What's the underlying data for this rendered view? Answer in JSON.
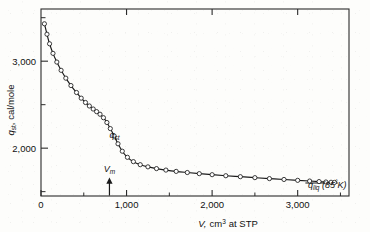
{
  "chart_data": {
    "type": "line",
    "title": "",
    "subtitle": "",
    "xlabel": "V, cm3 at STP",
    "xlabel_main": "V,",
    "xlabel_unit_base": "cm",
    "xlabel_unit_exp": "3",
    "xlabel_tail": "at STP",
    "ylabel_symbol": "q",
    "ylabel_symbol_sub": "st",
    "ylabel_rest": ", cal/mole",
    "xlim": [
      0,
      3600
    ],
    "ylim": [
      1450,
      3600
    ],
    "grid": false,
    "legend": "none",
    "x_major_ticks": [
      0,
      1000,
      2000,
      3000
    ],
    "x_major_tick_labels": [
      "0",
      "1,000",
      "2,000",
      "3,000"
    ],
    "x_minor_ticks": [
      500,
      1500,
      2500,
      3500
    ],
    "y_major_ticks": [
      2000,
      3000
    ],
    "y_major_tick_labels": [
      "2,000",
      "3,000"
    ],
    "y_minor_ticks": [
      1500,
      2500,
      3500
    ],
    "marker": "open-circle",
    "series": [
      {
        "name": "q_st",
        "x": [
          40,
          70,
          100,
          140,
          185,
          235,
          290,
          350,
          415,
          470,
          520,
          565,
          610,
          650,
          690,
          730,
          770,
          810,
          855,
          900,
          950,
          1010,
          1080,
          1160,
          1250,
          1350,
          1460,
          1580,
          1710,
          1850,
          2000,
          2160,
          2330,
          2500,
          2670,
          2840,
          3000,
          3140,
          3250,
          3330,
          3390,
          3430
        ],
        "y": [
          3430,
          3310,
          3200,
          3090,
          2990,
          2895,
          2805,
          2720,
          2640,
          2575,
          2525,
          2485,
          2450,
          2420,
          2390,
          2350,
          2295,
          2225,
          2140,
          2050,
          1965,
          1895,
          1845,
          1810,
          1785,
          1765,
          1748,
          1733,
          1720,
          1707,
          1695,
          1683,
          1672,
          1661,
          1650,
          1640,
          1630,
          1622,
          1616,
          1611,
          1608,
          1606
        ]
      }
    ],
    "reference_line": {
      "name": "q_liq (85 K)",
      "y": 1600,
      "x_start": 3090,
      "x_end": 3470
    },
    "annotations": [
      {
        "name": "q-st-curve-label",
        "text_symbol": "q",
        "text_sub": "st",
        "x": 800,
        "y": 2120
      },
      {
        "name": "vm-marker",
        "text_symbol": "V",
        "text_sub": "m",
        "x": 800,
        "arrow": "up",
        "y_label": 1730,
        "y_arrow_base": 1455,
        "y_arrow_tip": 1610
      },
      {
        "name": "q-liq-label",
        "text_symbol": "q",
        "text_sub": "liq",
        "text_paren_open": "(",
        "text_value": "85",
        "text_deg": "°",
        "text_kelvin": "K",
        "text_paren_close": ")",
        "x": 3120,
        "y": 1545
      }
    ],
    "colors": {
      "line": "#1a1a1a",
      "marker_fill": "#ffffff",
      "marker_stroke": "#1a1a1a",
      "axis": "#2b2b2b",
      "text": "#111111",
      "background": "#fdfdfb"
    }
  }
}
